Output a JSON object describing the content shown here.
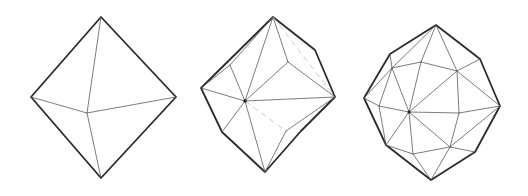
{
  "figure": {
    "panels": [
      {
        "name": "octahedron",
        "faces": 8
      },
      {
        "name": "subdivided-octahedron",
        "faces": 16
      },
      {
        "name": "geodesic-polyhedron",
        "faces": 32
      }
    ],
    "colors": {
      "outline": "#2b2b2b",
      "inner": "#5a5a5a",
      "hidden": "#bdbdbd"
    }
  }
}
